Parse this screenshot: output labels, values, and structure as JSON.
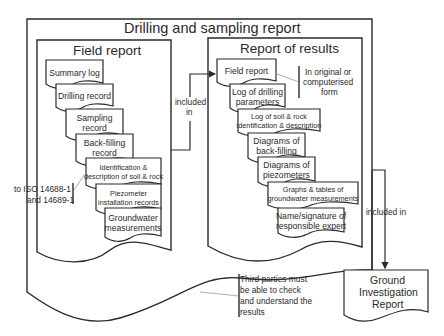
{
  "diagram": {
    "title": "Drilling and sampling report",
    "field_report": {
      "heading": "Field report",
      "documents": [
        [
          "Summary log"
        ],
        [
          "Drilling record"
        ],
        [
          "Sampling",
          "record"
        ],
        [
          "Back-filling",
          "record"
        ],
        [
          "Identification &",
          "description of soil & rock"
        ],
        [
          "Piezometer",
          "installation records"
        ],
        [
          "Groundwater",
          "measurements"
        ]
      ],
      "standard_note": [
        "to ISO 14688-1",
        "and 14689-1"
      ]
    },
    "report_of_results": {
      "heading": "Report of results",
      "documents": [
        [
          "Field report"
        ],
        [
          "Log of drilling",
          "parameters"
        ],
        [
          "Log of soil & rock",
          "identification & description"
        ],
        [
          "Diagrams of",
          "back-filling"
        ],
        [
          "Diagrams of",
          "piezometers"
        ],
        [
          "Graphs & tables of",
          "groundwater measurements"
        ],
        [
          "Name/signature of",
          "responsible expert"
        ]
      ],
      "form_note": [
        "In original or",
        "computerised",
        "form"
      ]
    },
    "arrow_labels": {
      "field_to_results": [
        "included",
        "in"
      ],
      "drilling_to_gir": "included in"
    },
    "ground_investigation_report": [
      "Ground",
      "Investigation",
      "Report"
    ],
    "third_parties_note": [
      "Third parties must",
      "be able to check",
      "and understand the",
      "results"
    ]
  }
}
